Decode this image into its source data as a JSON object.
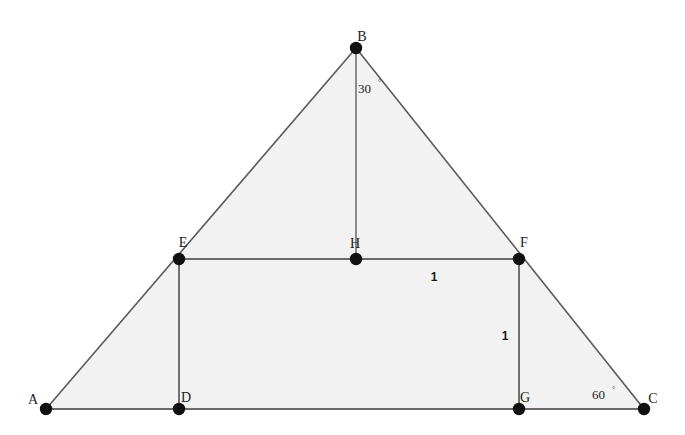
{
  "figure": {
    "background_color": "#ffffff",
    "fill_color": "#f2f2f2",
    "stroke_color": "#5a5a5a",
    "point_color": "#111111",
    "width": 685,
    "height": 435
  },
  "points": [
    {
      "id": "A",
      "label": "A",
      "x": 46,
      "y": 409,
      "label_x": 33,
      "label_y": 404
    },
    {
      "id": "B",
      "label": "B",
      "x": 356,
      "y": 48,
      "label_x": 362,
      "label_y": 41
    },
    {
      "id": "C",
      "label": "C",
      "x": 644,
      "y": 409,
      "label_x": 653,
      "label_y": 403
    },
    {
      "id": "D",
      "label": "D",
      "x": 179,
      "y": 409,
      "label_x": 186,
      "label_y": 402
    },
    {
      "id": "E",
      "label": "E",
      "x": 179,
      "y": 259,
      "label_x": 183,
      "label_y": 247
    },
    {
      "id": "F",
      "label": "F",
      "x": 519,
      "y": 259,
      "label_x": 524,
      "label_y": 247
    },
    {
      "id": "G",
      "label": "G",
      "x": 519,
      "y": 409,
      "label_x": 525,
      "label_y": 402
    },
    {
      "id": "H",
      "label": "H",
      "x": 356,
      "y": 259,
      "label_x": 355,
      "label_y": 248
    }
  ],
  "segments": [
    {
      "id": "AB",
      "from": "A",
      "to": "B",
      "style": "solid"
    },
    {
      "id": "BC",
      "from": "B",
      "to": "C",
      "style": "solid"
    },
    {
      "id": "AC",
      "from": "A",
      "to": "C",
      "style": "solid"
    },
    {
      "id": "BH",
      "from": "B",
      "to": "H",
      "style": "solid"
    },
    {
      "id": "EF",
      "from": "E",
      "to": "F",
      "style": "solid"
    },
    {
      "id": "ED",
      "from": "E",
      "to": "D",
      "style": "solid"
    },
    {
      "id": "FG",
      "from": "F",
      "to": "G",
      "style": "solid"
    }
  ],
  "angles": [
    {
      "id": "angle-B",
      "value": "30",
      "unit": "°",
      "vertex": "B",
      "x": 358,
      "y": 93,
      "deg_x": 378,
      "deg_y": 85
    },
    {
      "id": "angle-C",
      "value": "60",
      "unit": "°",
      "vertex": "C",
      "x": 592,
      "y": 399,
      "deg_x": 612,
      "deg_y": 392
    }
  ],
  "lengths": [
    {
      "id": "len-HF",
      "value": "1",
      "segment": "HF",
      "x": 434,
      "y": 281
    },
    {
      "id": "len-FG",
      "value": "1",
      "segment": "FG",
      "x": 505,
      "y": 340
    }
  ]
}
